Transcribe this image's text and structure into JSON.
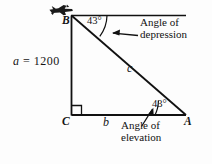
{
  "figure": {
    "background_color": "#fdfdfd",
    "line_color": "#111111",
    "vertices": {
      "B": "B",
      "C": "C",
      "A": "A"
    },
    "sides": {
      "a_label": "a",
      "a_equals": "=",
      "a_value": "1200",
      "b_label": "b",
      "c_label": "c"
    },
    "angles": {
      "at_B": "43°",
      "at_A": "43°"
    },
    "callouts": {
      "depression_line1": "Angle of",
      "depression_line2": "depression",
      "elevation_line1": "Angle of",
      "elevation_line2": "elevation"
    },
    "icons": {
      "airplane": "airplane-icon",
      "right_angle": "right-angle-marker-icon",
      "arrow_depression": "arrow-pointing-left-icon",
      "arrow_elevation": "arrow-pointing-upleft-icon"
    }
  }
}
